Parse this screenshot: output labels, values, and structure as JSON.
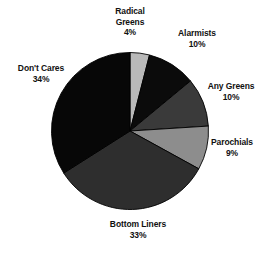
{
  "chart_data": {
    "type": "pie",
    "title": "",
    "subtitle": "",
    "xlabel": "",
    "ylabel": "",
    "legend_position": "none",
    "grid": false,
    "start_angle_deg": 0,
    "direction": "clockwise",
    "categories": [
      "Radical Greens",
      "Alarmists",
      "Any Greens",
      "Parochials",
      "Bottom Liners",
      "Don't Cares"
    ],
    "values": [
      4,
      10,
      10,
      9,
      33,
      34
    ],
    "value_labels": [
      "4%",
      "10%",
      "10%",
      "9%",
      "33%",
      "34%"
    ],
    "units": "percent",
    "total": 100,
    "colors": [
      "#b9b9b9",
      "#0b0b0b",
      "#3a3a3a",
      "#8d8d8d",
      "#2e2e2e",
      "#070707"
    ],
    "slices": [
      {
        "label": "Radical Greens",
        "value": 4,
        "value_label": "4%",
        "color": "#b9b9b9"
      },
      {
        "label": "Alarmists",
        "value": 10,
        "value_label": "10%",
        "color": "#0b0b0b"
      },
      {
        "label": "Any Greens",
        "value": 10,
        "value_label": "10%",
        "color": "#3a3a3a"
      },
      {
        "label": "Parochials",
        "value": 9,
        "value_label": "9%",
        "color": "#8d8d8d"
      },
      {
        "label": "Bottom Liners",
        "value": 33,
        "value_label": "33%",
        "color": "#2e2e2e"
      },
      {
        "label": "Don't Cares",
        "value": 34,
        "value_label": "34%",
        "color": "#070707"
      }
    ]
  },
  "labels": {
    "radical_greens": {
      "name": "Radical",
      "name2": "Greens",
      "value": "4%"
    },
    "alarmists": {
      "name": "Alarmists",
      "value": "10%"
    },
    "any_greens": {
      "name": "Any Greens",
      "value": "10%"
    },
    "parochials": {
      "name": "Parochials",
      "value": "9%"
    },
    "bottom_liners": {
      "name": "Bottom Liners",
      "value": "33%"
    },
    "dont_cares": {
      "name": "Don't Cares",
      "value": "34%"
    }
  },
  "style": {
    "background": "#ffffff",
    "text_color": "#111111",
    "slice_outline": "#000000"
  }
}
